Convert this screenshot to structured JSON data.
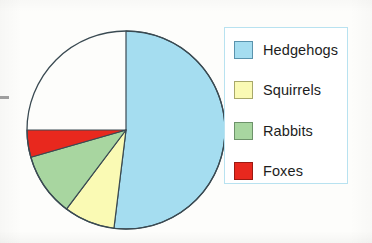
{
  "chart_data": {
    "type": "pie",
    "title": "",
    "categories": [
      "Hedgehogs",
      "Squirrels",
      "Rabbits",
      "Foxes"
    ],
    "values": [
      52,
      8.5,
      10.5,
      4.5
    ],
    "unit": "percent-of-circle",
    "angles_deg": [
      187,
      30,
      37,
      16
    ],
    "colors": [
      "#A5DDF0",
      "#FAFAB4",
      "#A8D6A0",
      "#E8281E"
    ],
    "start_angle_deg": 0,
    "direction": "clockwise",
    "legend_position": "right",
    "grid": false,
    "xlabel": "",
    "ylabel": ""
  },
  "pie": {
    "center_x": 102,
    "center_y": 102,
    "radius": 99,
    "outline_color": "#3a4a52",
    "slices": [
      {
        "name": "Hedgehogs",
        "color": "#A5DDF0",
        "angle": 187
      },
      {
        "name": "Squirrels",
        "color": "#FAFAB4",
        "angle": 30
      },
      {
        "name": "Rabbits",
        "color": "#A8D6A0",
        "angle": 37
      },
      {
        "name": "Foxes",
        "color": "#E8281E",
        "angle": 16
      }
    ]
  },
  "legend": {
    "border_color": "#b8e2f0",
    "items": [
      {
        "label": "Hedgehogs",
        "color": "#A5DDF0",
        "border": "#5a93ad",
        "top": 12
      },
      {
        "label": "Squirrels",
        "color": "#FAFAB4",
        "border": "#a8a86a",
        "top": 52
      },
      {
        "label": "Rabbits",
        "color": "#A8D6A0",
        "border": "#6d936a",
        "top": 93
      },
      {
        "label": "Foxes",
        "color": "#E8281E",
        "border": "#9c1a12",
        "top": 133
      }
    ]
  }
}
